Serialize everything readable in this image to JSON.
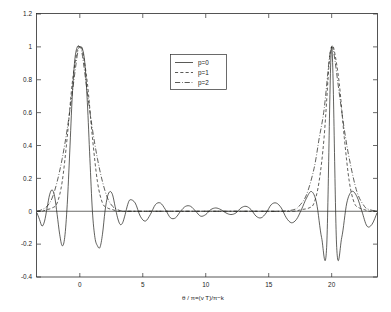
{
  "figure": {
    "background_color": "#ffffff",
    "axes_color": "#2b2b2b",
    "curve_color": "#23231f"
  },
  "chart_data": {
    "type": "line",
    "title": "",
    "subtitle": "",
    "xlabel": "θ / π=(v T)/π−k",
    "ylabel": "",
    "xlim": [
      -3.4,
      23.6
    ],
    "ylim": [
      -0.4,
      1.2
    ],
    "xticks": [
      0,
      5,
      10,
      15,
      20
    ],
    "xticklabels": [
      "0",
      "5",
      "10",
      "15",
      "20"
    ],
    "yticks": [
      -0.4,
      -0.2,
      0,
      0.2,
      0.4,
      0.6,
      0.8,
      1,
      1.2
    ],
    "yticklabels": [
      "-0.4",
      "-0.2",
      "0",
      "0.2",
      "0.4",
      "0.6",
      "0.8",
      "1",
      "1.2"
    ],
    "grid": false,
    "legend_position": "upper center",
    "legend": [
      {
        "label": "p=0",
        "linestyle": "solid",
        "color": "#23231f"
      },
      {
        "label": "p=1",
        "linestyle": "dashed",
        "color": "#23231f"
      },
      {
        "label": "p=2",
        "linestyle": "dashdot",
        "color": "#23231f"
      }
    ],
    "annotations": [
      {
        "text": "main lobe at θ/π = 0",
        "x": 0,
        "y": 1.0
      },
      {
        "text": "main lobe at θ/π = 20",
        "x": 20,
        "y": 1.0
      }
    ],
    "series": [
      {
        "name": "p=0",
        "linestyle": "solid",
        "peaks": [
          {
            "x": 0,
            "y": 1.0
          },
          {
            "x": 20,
            "y": 1.0
          }
        ],
        "sidelobe_peak_amplitude": 0.13,
        "sidelobe_trough_amplitude": -0.218,
        "description": "Dirichlet/sinc kernel with strong ringing sidelobes across the full domain",
        "x": [
          -3.4,
          -3.2,
          -3.0,
          -2.8,
          -2.6,
          -2.4,
          -2.2,
          -2.0,
          -1.8,
          -1.6,
          -1.4,
          -1.2,
          -1.0,
          -0.8,
          -0.6,
          -0.4,
          -0.2,
          0.0,
          0.2,
          0.4,
          0.6,
          0.8,
          1.0,
          1.2,
          1.4,
          1.6,
          1.8,
          2.0,
          2.2,
          2.4,
          2.6,
          2.8,
          3.0,
          3.2,
          3.4,
          3.6,
          3.8,
          4.0,
          4.4,
          4.8,
          5.2,
          5.6,
          6.0,
          6.4,
          6.8,
          7.2,
          7.6,
          8.0,
          8.4,
          8.8,
          9.2,
          9.6,
          10.0,
          10.4,
          10.8,
          11.2,
          11.6,
          12.0,
          12.4,
          12.8,
          13.2,
          13.6,
          14.0,
          14.4,
          14.8,
          15.2,
          15.6,
          16.0,
          16.4,
          16.8,
          17.2,
          17.6,
          18.0,
          18.4,
          18.8,
          19.2,
          19.6,
          20.0,
          20.4,
          20.8,
          21.2,
          21.6,
          22.0,
          22.4,
          22.8,
          23.2,
          23.6
        ],
        "y": [
          -0.01,
          -0.05,
          -0.09,
          -0.06,
          0.02,
          0.1,
          0.13,
          0.09,
          -0.02,
          -0.14,
          -0.21,
          -0.16,
          0.04,
          0.36,
          0.7,
          0.92,
          1.0,
          1.0,
          0.99,
          0.9,
          0.66,
          0.32,
          0.0,
          -0.16,
          -0.21,
          -0.22,
          -0.14,
          0.0,
          0.09,
          0.12,
          0.1,
          0.03,
          -0.04,
          -0.08,
          -0.07,
          -0.02,
          0.04,
          0.07,
          0.05,
          -0.03,
          -0.06,
          -0.02,
          0.04,
          0.05,
          0.01,
          -0.04,
          -0.04,
          0.0,
          0.03,
          0.03,
          0.0,
          -0.03,
          -0.02,
          0.01,
          0.02,
          0.01,
          -0.01,
          -0.02,
          -0.01,
          0.02,
          0.03,
          0.01,
          -0.03,
          -0.04,
          -0.01,
          0.04,
          0.05,
          0.02,
          -0.04,
          -0.07,
          -0.05,
          0.01,
          0.08,
          0.12,
          0.05,
          -0.16,
          -0.22,
          1.0,
          -0.22,
          -0.16,
          0.05,
          0.12,
          0.09,
          0.0,
          -0.09,
          -0.08,
          -0.01
        ]
      },
      {
        "name": "p=1",
        "linestyle": "dashed",
        "peaks": [
          {
            "x": 0,
            "y": 1.0
          },
          {
            "x": 20,
            "y": 1.0
          }
        ],
        "sidelobe_peak_amplitude": 0.02,
        "description": "Smoothed kernel, main lobes only, sidelobes strongly suppressed",
        "x": [
          -3.4,
          -3.0,
          -2.6,
          -2.2,
          -1.8,
          -1.4,
          -1.0,
          -0.6,
          -0.2,
          0.0,
          0.2,
          0.6,
          1.0,
          1.4,
          1.8,
          2.2,
          2.6,
          3.0,
          3.4,
          4.0,
          5.0,
          6.0,
          8.0,
          10.0,
          12.0,
          14.0,
          16.0,
          17.0,
          17.6,
          18.2,
          18.6,
          19.0,
          19.4,
          19.8,
          20.0,
          20.2,
          20.6,
          21.0,
          21.4,
          21.8,
          22.2,
          22.6,
          23.0,
          23.6
        ],
        "y": [
          0.0,
          0.0,
          0.01,
          0.02,
          0.05,
          0.18,
          0.45,
          0.78,
          0.98,
          1.0,
          0.98,
          0.78,
          0.45,
          0.18,
          0.05,
          0.02,
          0.01,
          0.0,
          0.0,
          0.0,
          0.0,
          0.0,
          0.0,
          0.0,
          0.0,
          0.0,
          0.0,
          0.0,
          0.01,
          0.02,
          0.05,
          0.18,
          0.45,
          0.9,
          1.0,
          0.98,
          0.78,
          0.45,
          0.18,
          0.05,
          0.02,
          0.01,
          0.0,
          0.0
        ]
      },
      {
        "name": "p=2",
        "linestyle": "dashdot",
        "peaks": [
          {
            "x": 0,
            "y": 1.0
          },
          {
            "x": 20,
            "y": 1.0
          }
        ],
        "sidelobe_peak_amplitude": 0.01,
        "description": "Most smoothed kernel, widest main lobe base, negligible sidelobes",
        "x": [
          -3.4,
          -3.0,
          -2.6,
          -2.2,
          -1.8,
          -1.4,
          -1.0,
          -0.6,
          -0.2,
          0.0,
          0.2,
          0.6,
          1.0,
          1.4,
          1.8,
          2.2,
          2.6,
          3.0,
          3.4,
          4.0,
          5.0,
          6.0,
          8.0,
          10.0,
          12.0,
          14.0,
          16.0,
          17.0,
          17.4,
          18.0,
          18.6,
          19.0,
          19.4,
          19.8,
          20.0,
          20.2,
          20.6,
          21.0,
          21.4,
          22.0,
          22.6,
          23.0,
          23.6
        ],
        "y": [
          0.0,
          0.01,
          0.03,
          0.08,
          0.18,
          0.32,
          0.5,
          0.72,
          0.95,
          1.0,
          0.95,
          0.72,
          0.5,
          0.32,
          0.18,
          0.08,
          0.03,
          0.01,
          0.0,
          0.0,
          0.0,
          0.0,
          0.0,
          0.0,
          0.0,
          0.0,
          0.0,
          0.01,
          0.03,
          0.1,
          0.26,
          0.44,
          0.62,
          0.92,
          1.0,
          0.95,
          0.72,
          0.5,
          0.32,
          0.12,
          0.03,
          0.01,
          0.0
        ]
      }
    ]
  }
}
